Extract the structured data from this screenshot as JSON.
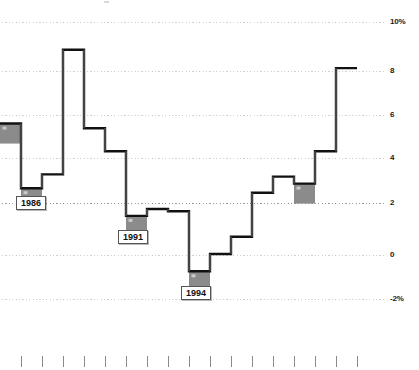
{
  "chart_data": {
    "type": "line",
    "subtype": "step",
    "title": "",
    "xlabel": "",
    "ylabel": "",
    "ylim": [
      -2,
      10
    ],
    "xlim": [
      0,
      17
    ],
    "grid": true,
    "legend": null,
    "y_ticks": [
      10,
      8,
      6,
      4,
      2,
      0,
      -2
    ],
    "y_tick_labels": [
      "10%",
      "8",
      "6",
      "4",
      "2",
      "0",
      "-2%"
    ],
    "x_tick_count": 17,
    "x_tick_labels": [
      "",
      "",
      "",
      "",
      "",
      "",
      "",
      "",
      "",
      "",
      "",
      "",
      "",
      "",
      "",
      "",
      ""
    ],
    "series": [
      {
        "name": "rate",
        "step": "post",
        "values": [
          5.6,
          2.8,
          3.4,
          8.8,
          5.4,
          4.4,
          1.6,
          1.9,
          1.8,
          -0.8,
          -0.05,
          0.7,
          2.6,
          3.3,
          3.0,
          4.4,
          8.0
        ]
      }
    ],
    "markers": [
      {
        "index": 0,
        "label": "",
        "value": 5.6
      },
      {
        "index": 1,
        "label": "1986",
        "value": 2.8
      },
      {
        "index": 6,
        "label": "1991",
        "value": 1.6
      },
      {
        "index": 9,
        "label": "1994",
        "value": -0.8
      },
      {
        "index": 14,
        "label": "",
        "value": 3.0
      }
    ],
    "annotations": [
      {
        "text": "1986",
        "value": 2.0
      },
      {
        "text": "1991",
        "value": 1.0
      },
      {
        "text": "1994",
        "value": -1.6
      }
    ]
  },
  "axis": {
    "y_labels": [
      {
        "text": "10%",
        "y": 22
      },
      {
        "text": "8",
        "y": 71
      },
      {
        "text": "6",
        "y": 115
      },
      {
        "text": "4",
        "y": 158
      },
      {
        "text": "2",
        "y": 203
      },
      {
        "text": "0",
        "y": 255
      },
      {
        "text": "-2%",
        "y": 299
      }
    ]
  },
  "labels": {
    "year_1986": "1986",
    "year_1991": "1991",
    "year_1994": "1994"
  },
  "colors": {
    "line": "#111111",
    "marker_fill": "#8b8b8b",
    "gridline": "#cfcfcf",
    "tick": "#8a8a8a",
    "text": "#111111",
    "background": "#ffffff"
  }
}
